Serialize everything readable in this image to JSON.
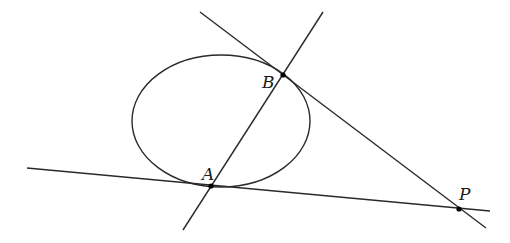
{
  "diagram": {
    "type": "geometry",
    "colors": {
      "stroke": "#2a2a2a",
      "point": "#000000",
      "background": "#ffffff"
    },
    "ellipse": {
      "cx": 221,
      "cy": 121,
      "rx": 89,
      "ry": 66
    },
    "points": [
      {
        "name": "A",
        "label": "A",
        "x": 211,
        "y": 186
      },
      {
        "name": "B",
        "label": "B",
        "x": 283,
        "y": 75
      },
      {
        "name": "P",
        "label": "P",
        "x": 459,
        "y": 209
      }
    ],
    "lines": [
      {
        "name": "line-AB",
        "x1": 323,
        "y1": 12,
        "x2": 183,
        "y2": 230
      },
      {
        "name": "tangent-at-B",
        "x1": 200,
        "y1": 12,
        "x2": 486,
        "y2": 228
      },
      {
        "name": "tangent-at-A",
        "x1": 27,
        "y1": 168,
        "x2": 490,
        "y2": 211
      }
    ]
  }
}
